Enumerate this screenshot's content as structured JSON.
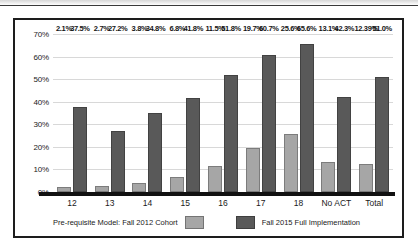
{
  "chart_data": {
    "type": "bar",
    "title": "",
    "subtitle": "",
    "xlabel": "",
    "ylabel": "",
    "ylim": [
      0,
      70
    ],
    "y_ticks": [
      "0%",
      "10%",
      "20%",
      "30%",
      "40%",
      "50%",
      "60%",
      "70%"
    ],
    "y_tick_values": [
      0,
      10,
      20,
      30,
      40,
      50,
      60,
      70
    ],
    "grid": true,
    "legend_position": "bottom",
    "categories": [
      "12",
      "13",
      "14",
      "15",
      "16",
      "17",
      "18",
      "No ACT",
      "Total"
    ],
    "series": [
      {
        "name": "Pre-requisite Model: Fall 2012 Cohort",
        "color": "#a6a6a6",
        "values": [
          2.1,
          2.7,
          3.8,
          6.8,
          11.5,
          19.7,
          25.6,
          13.1,
          12.39
        ],
        "labels": [
          "2.1%",
          "2.7%",
          "3.8%",
          "6.8%",
          "11.5%",
          "19.7%",
          "25.6%",
          "13.1%",
          "12.39%"
        ]
      },
      {
        "name": "Fall 2015 Full Implementation",
        "color": "#595959",
        "values": [
          37.5,
          27.2,
          34.8,
          41.8,
          51.8,
          60.7,
          65.6,
          42.3,
          51.0
        ],
        "labels": [
          "37.5%",
          "27.2%",
          "34.8%",
          "41.8%",
          "51.8%",
          "60.7%",
          "65.6%",
          "42.3%",
          "51.0%"
        ]
      }
    ]
  },
  "legend": {
    "entries": [
      {
        "label": "Pre-requisite Model: Fall 2012 Cohort",
        "swatch": "series-a"
      },
      {
        "label": "Fall 2015 Full Implementation",
        "swatch": "series-b"
      }
    ]
  },
  "colors": {
    "series_a": "#a6a6a6",
    "series_b": "#595959",
    "frame": "#1d1d1d",
    "gridline": "#d8d8d8",
    "baseline": "#111111"
  }
}
